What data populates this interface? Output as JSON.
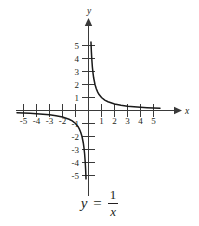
{
  "chart_data": {
    "type": "line",
    "title": "",
    "subtitle": "",
    "equation_lhs": "y",
    "equation_relation": "=",
    "equation_numerator": "1",
    "equation_denominator": "x",
    "equation_text": "y = 1/x",
    "function": "y = 1/x",
    "xlabel": "x",
    "ylabel": "y",
    "xlim": [
      -5.8,
      5.8
    ],
    "ylim": [
      -5.8,
      5.8
    ],
    "grid": false,
    "legend": false,
    "x_ticks": [
      -5,
      -4,
      -3,
      -2,
      -1,
      1,
      2,
      3,
      4,
      5
    ],
    "x_tick_labels": [
      "-5",
      "-4",
      "-3",
      "-2",
      "",
      "1",
      "2",
      "3",
      "4",
      "5"
    ],
    "y_ticks": [
      5,
      4,
      3,
      2,
      1,
      -1,
      -2,
      -3,
      -4,
      -5
    ],
    "y_tick_labels": [
      "5",
      "4",
      "3",
      "2",
      "1",
      "-1",
      "-2",
      "-3",
      "-4",
      "-5"
    ],
    "branches": [
      {
        "name": "branch-positive",
        "quadrant": "I",
        "x": [
          0.19,
          0.22,
          0.25,
          0.3,
          0.35,
          0.4,
          0.5,
          0.6,
          0.7,
          0.8,
          1.0,
          1.25,
          1.5,
          2.0,
          2.5,
          3.0,
          3.5,
          4.0,
          4.5,
          5.0,
          5.5
        ],
        "y": [
          5.26,
          4.55,
          4.0,
          3.33,
          2.86,
          2.5,
          2.0,
          1.67,
          1.43,
          1.25,
          1.0,
          0.8,
          0.67,
          0.5,
          0.4,
          0.33,
          0.29,
          0.25,
          0.22,
          0.2,
          0.18
        ]
      },
      {
        "name": "branch-negative",
        "quadrant": "III",
        "x": [
          -5.5,
          -5.0,
          -4.5,
          -4.0,
          -3.5,
          -3.0,
          -2.5,
          -2.0,
          -1.5,
          -1.25,
          -1.0,
          -0.8,
          -0.7,
          -0.6,
          -0.5,
          -0.4,
          -0.35,
          -0.3,
          -0.25,
          -0.22,
          -0.19
        ],
        "y": [
          -0.18,
          -0.2,
          -0.22,
          -0.25,
          -0.29,
          -0.33,
          -0.4,
          -0.5,
          -0.67,
          -0.8,
          -1.0,
          -1.25,
          -1.43,
          -1.67,
          -2.0,
          -2.5,
          -2.86,
          -3.33,
          -4.0,
          -4.55,
          -5.26
        ]
      }
    ],
    "colors": {
      "curve": "#1a1a1a",
      "axis": "#3a3a3a",
      "text": "#231f20",
      "background": "#ffffff"
    }
  }
}
